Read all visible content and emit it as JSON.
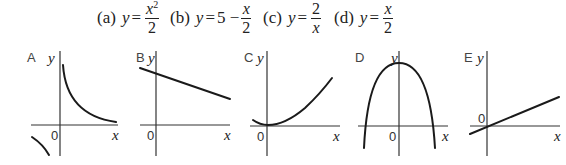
{
  "equations": [
    {
      "label": "(a)",
      "lhs": "y",
      "rel": "=",
      "prefix": "",
      "num": "x",
      "num_sup": "2",
      "den": "2"
    },
    {
      "label": "(b)",
      "lhs": "y",
      "rel": "=",
      "prefix": "5 −",
      "num": "x",
      "num_sup": "",
      "den": "2"
    },
    {
      "label": "(c)",
      "lhs": "y",
      "rel": "=",
      "prefix": "",
      "num": "2",
      "num_sup": "",
      "den": "x"
    },
    {
      "label": "(d)",
      "lhs": "y",
      "rel": "=",
      "prefix": "",
      "num": "x",
      "num_sup": "",
      "den": "2"
    }
  ],
  "graphs": [
    {
      "id": "A",
      "label": "A",
      "shape": "hyperbola-two-branches",
      "x_axis_label": "x",
      "y_axis_label": "y",
      "origin_label": "0"
    },
    {
      "id": "B",
      "label": "B",
      "shape": "decreasing-line-positive-intercept",
      "x_axis_label": "x",
      "y_axis_label": "y",
      "origin_label": "0"
    },
    {
      "id": "C",
      "label": "C",
      "shape": "upward-parabola-vertex-at-origin",
      "x_axis_label": "x",
      "y_axis_label": "y",
      "origin_label": "0"
    },
    {
      "id": "D",
      "label": "D",
      "shape": "downward-parabola-positive-vertex",
      "x_axis_label": "x",
      "y_axis_label": "y",
      "origin_label": "0"
    },
    {
      "id": "E",
      "label": "E",
      "shape": "increasing-line-through-origin",
      "x_axis_label": "x",
      "y_axis_label": "y",
      "origin_label": "0"
    }
  ],
  "colors": {
    "ink": "#1a1a1a",
    "axis": "#333333",
    "background": "#ffffff"
  }
}
